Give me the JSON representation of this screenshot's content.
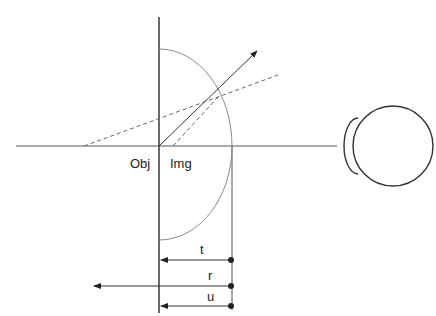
{
  "diagram": {
    "type": "optics-refraction-hemisphere",
    "labels": {
      "object": "Obj",
      "image": "Img",
      "t": "t",
      "r": "r",
      "u": "u"
    },
    "colors": {
      "line": "#333333",
      "arc": "#8a8a8a",
      "dashed": "#666666"
    },
    "elements": [
      "optical-axis",
      "flat-surface",
      "hemisphere-arc",
      "refracted-ray-arrow",
      "dashed-apparent-ray",
      "dashed-extended-ray",
      "eye",
      "dimension-t",
      "dimension-r",
      "dimension-u"
    ]
  }
}
